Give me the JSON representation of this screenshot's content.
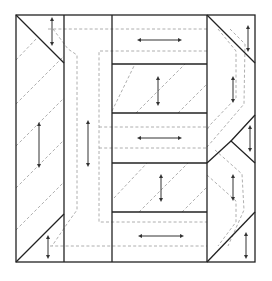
{
  "diagram": {
    "type": "quilt-block-cutting-layout",
    "colors": {
      "cut_line": "#222222",
      "seam_line": "#9a9a9a",
      "grain_arrow": "#333333",
      "background": "#ffffff"
    },
    "outer_square": {
      "x1": 16,
      "y1": 15,
      "x2": 255,
      "y2": 262
    },
    "columns": [
      {
        "name": "left-column",
        "x1": 16,
        "x2": 64
      },
      {
        "name": "second-column",
        "x1": 64,
        "x2": 112
      },
      {
        "name": "center-column",
        "x1": 112,
        "x2": 207
      },
      {
        "name": "right-column",
        "x1": 207,
        "x2": 255
      }
    ],
    "center_rows_y": [
      15,
      64,
      113,
      163,
      212,
      262
    ],
    "grain_arrows": [
      {
        "orientation": "vertical",
        "x": 52,
        "y1": 19,
        "y2": 44
      },
      {
        "orientation": "vertical",
        "x": 39,
        "y1": 124,
        "y2": 166
      },
      {
        "orientation": "vertical",
        "x": 88,
        "y1": 122,
        "y2": 165
      },
      {
        "orientation": "vertical",
        "x": 48,
        "y1": 237,
        "y2": 257
      },
      {
        "orientation": "horizontal",
        "y": 40,
        "x1": 139,
        "x2": 180
      },
      {
        "orientation": "vertical",
        "x": 158,
        "y1": 78,
        "y2": 104
      },
      {
        "orientation": "horizontal",
        "y": 138,
        "x1": 139,
        "x2": 180
      },
      {
        "orientation": "vertical",
        "x": 161,
        "y1": 176,
        "y2": 200
      },
      {
        "orientation": "horizontal",
        "y": 236,
        "x1": 140,
        "x2": 182
      },
      {
        "orientation": "vertical",
        "x": 248,
        "y1": 27,
        "y2": 50
      },
      {
        "orientation": "vertical",
        "x": 233,
        "y1": 78,
        "y2": 101
      },
      {
        "orientation": "vertical",
        "x": 250,
        "y1": 127,
        "y2": 150
      },
      {
        "orientation": "vertical",
        "x": 233,
        "y1": 176,
        "y2": 199
      },
      {
        "orientation": "vertical",
        "x": 246,
        "y1": 234,
        "y2": 257
      }
    ]
  }
}
